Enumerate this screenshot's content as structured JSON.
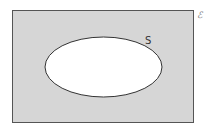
{
  "diagram": {
    "type": "venn",
    "universal_set": {
      "label": "ℰ",
      "fill": "#d6d6d6",
      "stroke": "#555555",
      "x": 12,
      "y": 11,
      "width": 181,
      "height": 112
    },
    "sets": [
      {
        "label": "S",
        "fill": "#ffffff",
        "stroke": "#333333",
        "cx": 103.5,
        "cy": 67,
        "rx": 58.5,
        "ry": 30
      }
    ],
    "shaded_region": "S'"
  }
}
